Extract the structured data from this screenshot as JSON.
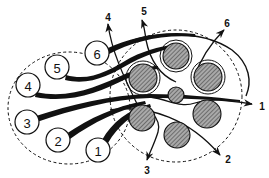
{
  "diagram": {
    "title": "",
    "colors": {
      "line": "#111111",
      "hatch_fill": "#8a8a8a",
      "background": "#ffffff"
    },
    "left_group": {
      "shape": "dashed-ellipse",
      "nodes": [
        {
          "id": "1",
          "label": "1"
        },
        {
          "id": "2",
          "label": "2"
        },
        {
          "id": "3",
          "label": "3"
        },
        {
          "id": "4",
          "label": "4"
        },
        {
          "id": "5",
          "label": "5"
        },
        {
          "id": "6",
          "label": "6"
        }
      ]
    },
    "right_group": {
      "shape": "dashed-circle",
      "hatched_circles": 7,
      "description": "six large hatched cylinders arranged around one small central hatched cylinder"
    },
    "arrows": [
      {
        "label": "1",
        "direction": "right"
      },
      {
        "label": "2",
        "direction": "down-right"
      },
      {
        "label": "3",
        "direction": "down"
      },
      {
        "label": "4",
        "direction": "up"
      },
      {
        "label": "5",
        "direction": "up"
      },
      {
        "label": "6",
        "direction": "up-right"
      }
    ]
  }
}
